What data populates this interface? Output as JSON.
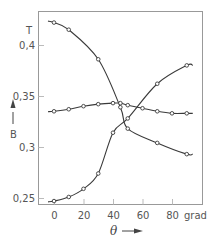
{
  "chart_data": {
    "type": "line",
    "title": "",
    "xlabel": "θ",
    "xunit": "grad",
    "ylabel": "B",
    "yunit": "T",
    "xlim": [
      -10,
      100
    ],
    "ylim": [
      0.245,
      0.43
    ],
    "x_ticks": [
      0,
      20,
      40,
      60,
      80
    ],
    "x_tick_labels": [
      "0",
      "20",
      "40",
      "60",
      "80"
    ],
    "y_ticks": [
      0.25,
      0.3,
      0.35,
      0.4
    ],
    "y_tick_labels": [
      "0,25",
      "0,3",
      "0,35",
      "0,4"
    ],
    "grid": false,
    "legend": null,
    "series": [
      {
        "name": "decreasing",
        "x": [
          0,
          10,
          30,
          45,
          50,
          70,
          90
        ],
        "values": [
          0.422,
          0.415,
          0.386,
          0.339,
          0.318,
          0.304,
          0.293
        ]
      },
      {
        "name": "flat",
        "x": [
          0,
          10,
          20,
          30,
          40,
          45,
          50,
          60,
          70,
          80,
          90
        ],
        "values": [
          0.335,
          0.337,
          0.34,
          0.342,
          0.343,
          0.343,
          0.341,
          0.338,
          0.335,
          0.333,
          0.333
        ]
      },
      {
        "name": "increasing",
        "x": [
          0,
          10,
          20,
          30,
          40,
          50,
          70,
          90
        ],
        "values": [
          0.247,
          0.251,
          0.259,
          0.274,
          0.314,
          0.328,
          0.362,
          0.38
        ]
      }
    ]
  },
  "labels": {
    "y_unit": "T",
    "y_name": "B",
    "x_name": "θ",
    "x_unit": "grad"
  }
}
